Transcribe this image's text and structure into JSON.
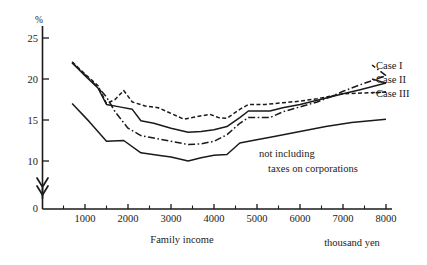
{
  "chart_data": {
    "type": "line",
    "title": "",
    "xlabel": "Family income",
    "xunit": "thousand yen",
    "ylabel": "%",
    "xlim": [
      0,
      8400
    ],
    "ylim": [
      0,
      27
    ],
    "y_axis_break": true,
    "y_break_symbol": "double-chevron-arrow",
    "grid": false,
    "legend_position": "right",
    "xticks": [
      1000,
      2000,
      3000,
      4000,
      5000,
      6000,
      7000,
      8000
    ],
    "xtick_labels": [
      "1000",
      "2000",
      "3000",
      "4000",
      "5000",
      "6000",
      "7000",
      "8000"
    ],
    "xminor_ticks": [
      500,
      1500,
      2500,
      3500,
      4500,
      5500,
      6500,
      7500
    ],
    "yticks": [
      0,
      10,
      15,
      20,
      25
    ],
    "ytick_labels": [
      "0",
      "10",
      "15",
      "20",
      "25"
    ],
    "series": [
      {
        "name": "Case I",
        "style": "dash-dot",
        "x": [
          700,
          1000,
          1300,
          1500,
          1700,
          2000,
          2300,
          2600,
          3000,
          3400,
          3700,
          4000,
          4300,
          4600,
          4800,
          5300,
          5600,
          6000,
          6400,
          6700,
          7000,
          7400,
          8000
        ],
        "values": [
          22.0,
          20.5,
          19.0,
          17.8,
          16.0,
          14.0,
          13.1,
          12.8,
          12.4,
          12.0,
          12.1,
          12.4,
          13.2,
          14.6,
          15.3,
          15.3,
          16.0,
          16.6,
          17.2,
          17.8,
          18.5,
          19.3,
          20.4
        ]
      },
      {
        "name": "Case II",
        "style": "solid",
        "x": [
          700,
          1000,
          1300,
          1500,
          1800,
          2100,
          2300,
          2600,
          3000,
          3400,
          3700,
          4000,
          4300,
          4600,
          4800,
          5300,
          5600,
          6000,
          6400,
          6700,
          7000,
          7400,
          8000
        ],
        "values": [
          22.0,
          20.4,
          18.9,
          16.9,
          16.6,
          16.3,
          14.9,
          14.6,
          14.0,
          13.5,
          13.6,
          13.8,
          14.2,
          15.3,
          16.1,
          16.1,
          16.5,
          16.9,
          17.4,
          17.8,
          18.2,
          18.7,
          19.5
        ]
      },
      {
        "name": "Case III",
        "style": "dashed-short",
        "x": [
          700,
          1000,
          1300,
          1500,
          1700,
          1900,
          2100,
          2400,
          2700,
          3000,
          3300,
          3600,
          3900,
          4100,
          4300,
          4600,
          4800,
          5200,
          5600,
          6000,
          6400,
          6700,
          7000,
          7500,
          8000
        ],
        "values": [
          22.1,
          20.6,
          19.2,
          17.0,
          17.5,
          18.6,
          17.2,
          16.7,
          16.5,
          15.8,
          15.1,
          15.4,
          15.7,
          15.3,
          15.2,
          16.3,
          16.9,
          16.9,
          17.1,
          17.3,
          17.6,
          17.9,
          18.2,
          18.3,
          18.4
        ]
      },
      {
        "name": "not including taxes on corporations",
        "style": "solid",
        "x": [
          700,
          1100,
          1500,
          1900,
          2300,
          2700,
          3000,
          3400,
          3700,
          4000,
          4300,
          4600,
          4900,
          5400,
          6000,
          6600,
          7200,
          8000
        ],
        "values": [
          17.0,
          14.8,
          12.4,
          12.5,
          11.0,
          10.7,
          10.5,
          10.0,
          10.4,
          10.7,
          10.8,
          12.2,
          12.5,
          13.0,
          13.6,
          14.2,
          14.7,
          15.1
        ]
      }
    ],
    "annotations": [
      {
        "text_line1": "not including",
        "text_line2": "taxes on corporations",
        "x": 5300,
        "y": 11.8
      }
    ],
    "legend_entries": [
      "Case I",
      "Case II",
      "Case III"
    ]
  }
}
